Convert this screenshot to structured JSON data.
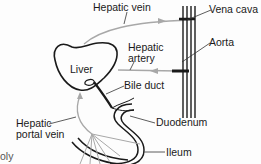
{
  "diagram": {
    "labels": {
      "hepatic_vein": "Hepatic vein",
      "vena_cava": "Vena cava",
      "aorta": "Aorta",
      "hepatic_artery_line1": "Hepatic",
      "hepatic_artery_line2": "artery",
      "liver": "Liver",
      "bile_duct": "Bile duct",
      "hepatic_portal_vein_line1": "Hepatic",
      "hepatic_portal_vein_line2": "portal vein",
      "duodenum": "Duodenum",
      "ileum": "Ileum",
      "cut_off_text": "oly"
    },
    "colors": {
      "outline": "#1a1a1a",
      "vessel_gray": "#a8a8a8",
      "leader": "#333333"
    }
  }
}
